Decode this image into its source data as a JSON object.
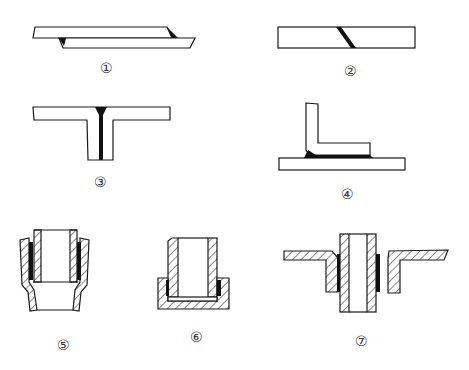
{
  "diagram": {
    "type": "weld/joint types",
    "figures": [
      {
        "id": 1,
        "label": "①",
        "description": "lap joint with fillet welds"
      },
      {
        "id": 2,
        "label": "②",
        "description": "butt joint with diagonal (scarf) weld"
      },
      {
        "id": 3,
        "label": "③",
        "description": "T-joint with weld in seam"
      },
      {
        "id": 4,
        "label": "④",
        "description": "L-angle on base plate with fillet weld"
      },
      {
        "id": 5,
        "label": "⑤",
        "description": "tube inserted into flared socket, sectioned"
      },
      {
        "id": 6,
        "label": "⑥",
        "description": "tube inserted into cup/cap, sectioned"
      },
      {
        "id": 7,
        "label": "⑦",
        "description": "tube through flanged collar in plate, sectioned"
      }
    ]
  },
  "colors": {
    "line": "#1a1a1a",
    "weld": "#111111",
    "background": "#ffffff",
    "label": "#333333"
  }
}
